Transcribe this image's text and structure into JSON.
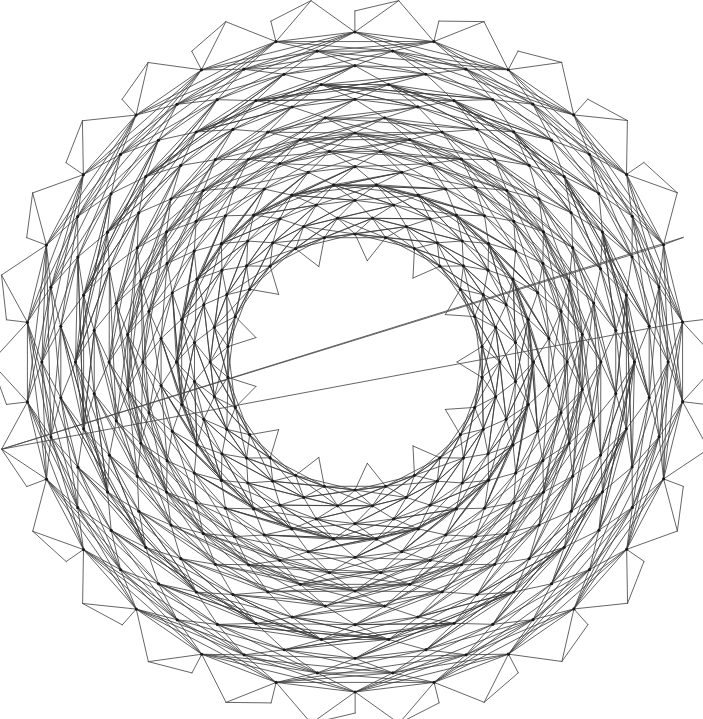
{
  "figure": {
    "clipped_header_text": "",
    "canvas": {
      "width": 703,
      "height": 719,
      "background_color": "#ffffff"
    },
    "style": {
      "edge_color": "#3b3b3b",
      "edge_width": 0.8,
      "node_color": "#1a1a1a",
      "node_radius": 1.6,
      "spike_edge_color": "#4a4a4a",
      "spike_edge_width": 0.85
    }
  },
  "chart_data": {
    "type": "diagram",
    "subtype": "annular-triangulated-mesh",
    "title": "",
    "xlabel": "",
    "ylabel": "",
    "grid": false,
    "legend": null,
    "geometry": {
      "center_x": 355,
      "center_y": 362,
      "outer_radius": 330,
      "inner_radius": 128,
      "angular_sectors": 26,
      "radial_layers": 13,
      "outer_spike_count": 26,
      "outer_spike_length": 34,
      "inner_spike_count": 13,
      "inner_spike_length": 26,
      "angular_twist_per_layer": 0.1208,
      "radial_spacing_mode": "uniform"
    },
    "connectivity": {
      "ring_edges": true,
      "radial_edges": true,
      "diagonal_edges_forward": true,
      "diagonal_edges_backward": true,
      "long_chord_skip": 2,
      "long_chord_layers_mod": 3
    },
    "counts": {
      "approx_nodes": 338,
      "approx_edges": 1680,
      "approx_triangles": 1300
    },
    "bounds": {
      "x_min": 25,
      "x_max": 692,
      "y_min": 16,
      "y_max": 708
    }
  }
}
